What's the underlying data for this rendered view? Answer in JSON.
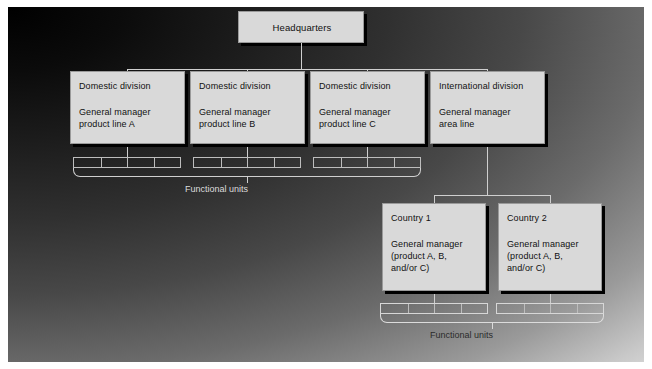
{
  "diagram": {
    "headquarters": {
      "label": "Headquarters"
    },
    "divisions": [
      {
        "heading": "Domestic division",
        "line1": "General manager",
        "line2": "product line A"
      },
      {
        "heading": "Domestic division",
        "line1": "General manager",
        "line2": "product line B"
      },
      {
        "heading": "Domestic division",
        "line1": "General manager",
        "line2": "product line C"
      },
      {
        "heading": "International division",
        "line1": "General manager",
        "line2": "area line"
      }
    ],
    "countries": [
      {
        "heading": "Country 1",
        "line1": "General manager",
        "line2": "(product A, B,",
        "line3": "and/or C)"
      },
      {
        "heading": "Country 2",
        "line1": "General manager",
        "line2": "(product A, B,",
        "line3": "and/or C)"
      }
    ],
    "functional_units_label_domestic": "Functional units",
    "functional_units_label_international": "Functional units",
    "colors": {
      "box_fill": "#d9d9d9",
      "box_shadow": "#000000",
      "connector": "#cfcfcf",
      "text": "#111111",
      "label_text": "#dcdcdc"
    }
  }
}
